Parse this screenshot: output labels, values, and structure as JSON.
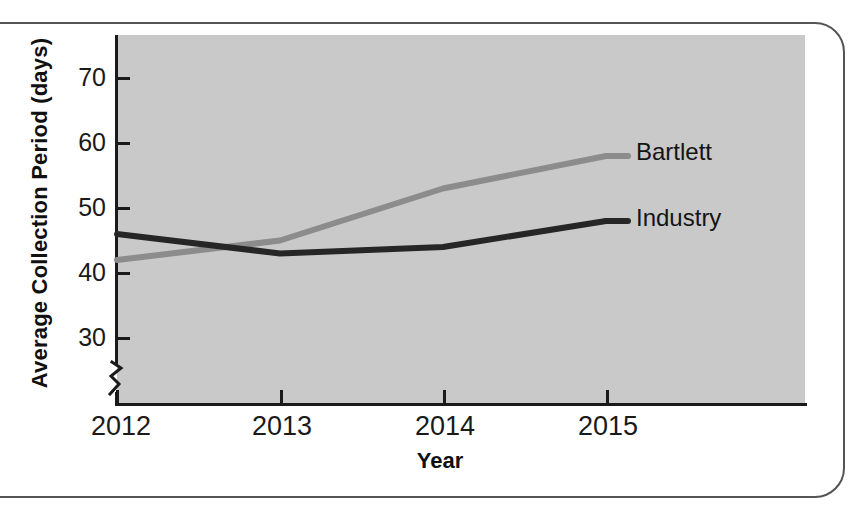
{
  "chart_data": {
    "type": "line",
    "title": "",
    "xlabel": "Year",
    "ylabel": "Average Collection Period (days)",
    "categories": [
      "2012",
      "2013",
      "2014",
      "2015"
    ],
    "x": [
      2012,
      2013,
      2014,
      2015
    ],
    "series": [
      {
        "name": "Bartlett",
        "values": [
          42,
          45,
          53,
          58
        ],
        "color": "#8c8c8c",
        "label_x": 2015,
        "label_y": 58
      },
      {
        "name": "Industry",
        "values": [
          46,
          43,
          44,
          48
        ],
        "color": "#262626",
        "label_x": 2015,
        "label_y": 48
      }
    ],
    "yticks": [
      30,
      40,
      50,
      60,
      70
    ],
    "ytick_labels": [
      "30",
      "40",
      "50",
      "60",
      "70"
    ],
    "xtick_labels": [
      "2012",
      "2013",
      "2014",
      "2015"
    ],
    "ylim": [
      26,
      74
    ],
    "xlim": [
      2012,
      2015
    ],
    "y_axis_break": true,
    "grid": false,
    "legend": "inline-series-labels",
    "plot_background": "#c9c9c9",
    "axis_color": "#1a1a1a"
  },
  "axes": {
    "y_title": "Average Collection Period (days)",
    "x_title": "Year",
    "ytick_0": "30",
    "ytick_1": "40",
    "ytick_2": "50",
    "ytick_3": "60",
    "ytick_4": "70",
    "xtick_0": "2012",
    "xtick_1": "2013",
    "xtick_2": "2014",
    "xtick_3": "2015"
  },
  "annotations": {
    "bartlett": "Bartlett",
    "industry": "Industry"
  }
}
